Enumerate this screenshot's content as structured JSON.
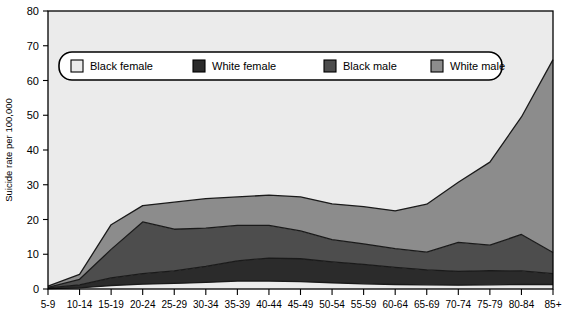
{
  "chart_data": {
    "type": "area",
    "stacked": true,
    "title": "",
    "xlabel": "",
    "ylabel": "Suicide rate per 100,000",
    "ylim": [
      0,
      80
    ],
    "yticks": [
      0,
      10,
      20,
      30,
      40,
      50,
      60,
      70,
      80
    ],
    "grid": false,
    "legend_position": "top-inside",
    "categories": [
      "5-9",
      "10-14",
      "15-19",
      "20-24",
      "25-29",
      "30-34",
      "35-39",
      "40-44",
      "45-49",
      "50-54",
      "55-59",
      "60-64",
      "65-69",
      "70-74",
      "75-79",
      "80-84",
      "85+"
    ],
    "series": [
      {
        "name": "Black female",
        "color": "#ebebeb",
        "values": [
          0.1,
          0.3,
          1.0,
          1.4,
          1.6,
          1.9,
          2.3,
          2.3,
          2.1,
          1.8,
          1.5,
          1.3,
          1.2,
          1.1,
          1.2,
          1.3,
          1.3
        ]
      },
      {
        "name": "White female",
        "color": "#2b2b2b",
        "values": [
          0.2,
          0.9,
          2.2,
          3.0,
          3.6,
          4.6,
          5.8,
          6.6,
          6.6,
          6.0,
          5.6,
          4.9,
          4.3,
          4.0,
          4.1,
          3.9,
          3.1
        ]
      },
      {
        "name": "Black male",
        "color": "#4d4d4d",
        "values": [
          0.2,
          1.6,
          8.2,
          14.9,
          12.0,
          11.0,
          10.2,
          9.4,
          8.0,
          6.4,
          5.9,
          5.4,
          5.1,
          8.3,
          7.3,
          10.5,
          6.1
        ]
      },
      {
        "name": "White male",
        "color": "#8c8c8c",
        "values": [
          0.3,
          1.4,
          7.1,
          4.7,
          7.8,
          8.5,
          8.2,
          8.7,
          9.8,
          10.3,
          10.7,
          10.9,
          13.8,
          17.3,
          23.9,
          33.8,
          55.5
        ]
      }
    ],
    "totals_note": "Stacked totals: ~24 at 20-24, ~23 at 60-64, ~66 at 85+"
  },
  "axis": {
    "y_label": "Suicide rate per 100,000",
    "y_ticks": [
      "0",
      "10",
      "20",
      "30",
      "40",
      "50",
      "60",
      "70",
      "80"
    ],
    "x_ticks": [
      "5-9",
      "10-14",
      "15-19",
      "20-24",
      "25-29",
      "30-34",
      "35-39",
      "40-44",
      "45-49",
      "50-54",
      "55-59",
      "60-64",
      "65-69",
      "70-74",
      "75-79",
      "80-84",
      "85+"
    ]
  },
  "legend": {
    "items": [
      {
        "label": "Black female",
        "swatch": "#ebebeb"
      },
      {
        "label": "White female",
        "swatch": "#2b2b2b"
      },
      {
        "label": "Black male",
        "swatch": "#4d4d4d"
      },
      {
        "label": "White male",
        "swatch": "#8c8c8c"
      }
    ]
  },
  "colors": {
    "plot_background": "#ebebeb",
    "page_background": "#ffffff",
    "axis": "#000000",
    "outline": "#1a1a1a"
  }
}
